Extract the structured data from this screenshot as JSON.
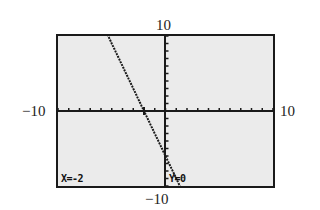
{
  "window": {
    "ymax_label": "10",
    "ymin_label": "−10",
    "xmin_label": "−10",
    "xmax_label": "10"
  },
  "trace": {
    "x_readout": "X=-2",
    "y_readout": "Y=0"
  },
  "graph": {
    "xmin": -10,
    "xmax": 10,
    "ymin": -10,
    "ymax": 10,
    "xscl": 1,
    "yscl": 1,
    "function": "y = -3x - 6",
    "trace_point": {
      "x": -2,
      "y": 0
    },
    "colors": {
      "screen": "#ebebeb",
      "ink": "#1a1a1a"
    }
  }
}
